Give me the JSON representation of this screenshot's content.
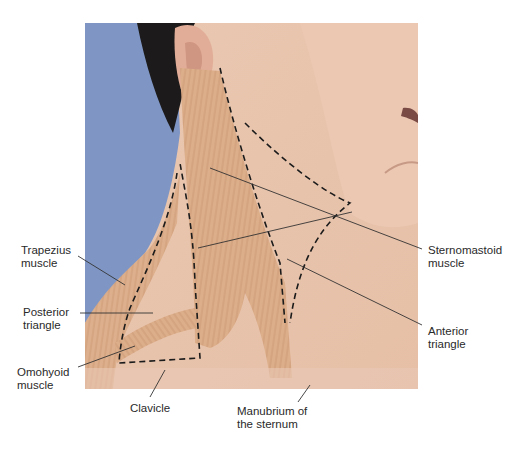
{
  "figure": {
    "colors": {
      "background_blue": "#7f96c4",
      "skin": "#e9c4ad",
      "muscle": "#d9a985",
      "hair": "#1c1a1a",
      "leader_line": "#333333"
    },
    "labels": {
      "trapezius": "Trapezius\nmuscle",
      "posterior_triangle": "Posterior\ntriangle",
      "omohyoid": "Omohyoid\nmuscle",
      "clavicle": "Clavicle",
      "manubrium": "Manubrium of\nthe sternum",
      "sternomastoid": "Sternomastoid\nmuscle",
      "anterior_triangle": "Anterior\ntriangle"
    }
  }
}
